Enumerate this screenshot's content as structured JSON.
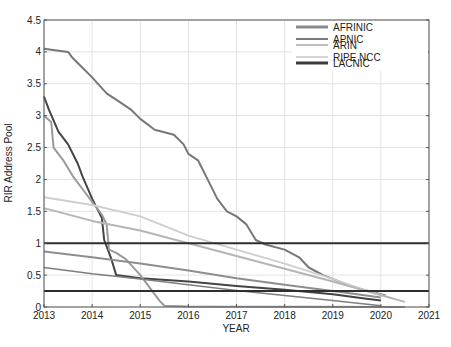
{
  "chart_data": {
    "type": "line",
    "title": "",
    "xlabel": "YEAR",
    "ylabel": "RIR Address Pool",
    "xlim": [
      2013,
      2021
    ],
    "ylim": [
      0,
      4.5
    ],
    "grid": true,
    "legend_position": "top-right",
    "xticks": [
      "2013",
      "2014",
      "2015",
      "2016",
      "2017",
      "2018",
      "2019",
      "2020",
      "2021"
    ],
    "yticks": [
      "0",
      "0.5",
      "1",
      "1.5",
      "2",
      "2.5",
      "3",
      "3.5",
      "4",
      "4.5"
    ],
    "legend": [
      {
        "name": "AFRINIC",
        "color": "#8a8a8a",
        "width": 3
      },
      {
        "name": "APNIC",
        "color": "#7a7a7a",
        "width": 2
      },
      {
        "name": "ARIN",
        "color": "#bdbdbd",
        "width": 2
      },
      {
        "name": "RIPE NCC",
        "color": "#d4d4d4",
        "width": 2
      },
      {
        "name": "LACNIC",
        "color": "#3c3c3c",
        "width": 3
      }
    ],
    "series": [
      {
        "name": "APNIC (upper stepped)",
        "color": "#777777",
        "width": 2,
        "points": [
          [
            2013.0,
            4.05
          ],
          [
            2013.5,
            4.0
          ],
          [
            2013.6,
            3.9
          ],
          [
            2013.8,
            3.75
          ],
          [
            2014.0,
            3.6
          ],
          [
            2014.3,
            3.35
          ],
          [
            2014.6,
            3.2
          ],
          [
            2014.8,
            3.1
          ],
          [
            2015.0,
            2.95
          ],
          [
            2015.3,
            2.78
          ],
          [
            2015.7,
            2.7
          ],
          [
            2015.9,
            2.55
          ],
          [
            2016.0,
            2.4
          ],
          [
            2016.2,
            2.3
          ],
          [
            2016.4,
            2.0
          ],
          [
            2016.6,
            1.7
          ],
          [
            2016.8,
            1.5
          ],
          [
            2017.0,
            1.42
          ],
          [
            2017.2,
            1.3
          ],
          [
            2017.4,
            1.05
          ],
          [
            2017.6,
            0.98
          ],
          [
            2018.0,
            0.9
          ],
          [
            2018.3,
            0.78
          ],
          [
            2018.5,
            0.62
          ],
          [
            2018.8,
            0.5
          ],
          [
            2019.0,
            0.44
          ],
          [
            2019.3,
            0.35
          ],
          [
            2019.6,
            0.28
          ],
          [
            2019.9,
            0.22
          ],
          [
            2020.1,
            0.18
          ]
        ]
      },
      {
        "name": "LACNIC (early steep)",
        "color": "#444444",
        "width": 2,
        "points": [
          [
            2013.0,
            3.3
          ],
          [
            2013.1,
            3.1
          ],
          [
            2013.3,
            2.75
          ],
          [
            2013.5,
            2.55
          ],
          [
            2013.7,
            2.25
          ],
          [
            2013.8,
            2.05
          ],
          [
            2014.0,
            1.7
          ],
          [
            2014.2,
            1.4
          ],
          [
            2014.25,
            1.05
          ],
          [
            2014.4,
            0.75
          ],
          [
            2014.5,
            0.5
          ],
          [
            2015.0,
            0.45
          ],
          [
            2016.0,
            0.4
          ],
          [
            2017.0,
            0.33
          ],
          [
            2018.0,
            0.27
          ],
          [
            2019.0,
            0.2
          ],
          [
            2019.7,
            0.13
          ],
          [
            2020.0,
            0.1
          ]
        ]
      },
      {
        "name": "ARIN (early drop)",
        "color": "#9a9a9a",
        "width": 2,
        "points": [
          [
            2013.0,
            3.0
          ],
          [
            2013.15,
            2.9
          ],
          [
            2013.2,
            2.5
          ],
          [
            2013.4,
            2.3
          ],
          [
            2013.6,
            2.05
          ],
          [
            2013.8,
            1.85
          ],
          [
            2014.0,
            1.65
          ],
          [
            2014.2,
            1.45
          ],
          [
            2014.3,
            1.3
          ],
          [
            2014.35,
            0.9
          ],
          [
            2014.5,
            0.85
          ],
          [
            2014.7,
            0.75
          ],
          [
            2015.0,
            0.5
          ],
          [
            2015.2,
            0.3
          ],
          [
            2015.4,
            0.1
          ],
          [
            2015.5,
            0.02
          ],
          [
            2016.0,
            0.01
          ],
          [
            2020.5,
            0.0
          ]
        ]
      },
      {
        "name": "RIPE NCC (linear light)",
        "color": "#cfcfcf",
        "width": 2,
        "points": [
          [
            2013.0,
            1.72
          ],
          [
            2014.0,
            1.6
          ],
          [
            2015.0,
            1.42
          ],
          [
            2016.0,
            1.12
          ],
          [
            2017.0,
            0.9
          ],
          [
            2018.0,
            0.68
          ],
          [
            2019.0,
            0.44
          ],
          [
            2019.6,
            0.28
          ],
          [
            2020.3,
            0.12
          ]
        ]
      },
      {
        "name": "ARIN (linear light)",
        "color": "#b5b5b5",
        "width": 2,
        "points": [
          [
            2013.0,
            1.55
          ],
          [
            2014.0,
            1.35
          ],
          [
            2015.0,
            1.2
          ],
          [
            2016.0,
            1.0
          ],
          [
            2017.0,
            0.8
          ],
          [
            2018.0,
            0.6
          ],
          [
            2019.0,
            0.4
          ],
          [
            2019.7,
            0.25
          ],
          [
            2020.5,
            0.08
          ]
        ]
      },
      {
        "name": "AFRINIC (linear mid)",
        "color": "#8e8e8e",
        "width": 2,
        "points": [
          [
            2013.0,
            0.87
          ],
          [
            2014.0,
            0.78
          ],
          [
            2015.0,
            0.68
          ],
          [
            2016.0,
            0.57
          ],
          [
            2017.0,
            0.45
          ],
          [
            2018.0,
            0.35
          ],
          [
            2019.0,
            0.25
          ],
          [
            2020.0,
            0.15
          ]
        ]
      },
      {
        "name": "LACNIC (linear low)",
        "color": "#7e7e7e",
        "width": 1.5,
        "points": [
          [
            2013.0,
            0.62
          ],
          [
            2014.0,
            0.52
          ],
          [
            2015.0,
            0.44
          ],
          [
            2016.0,
            0.35
          ],
          [
            2017.0,
            0.26
          ],
          [
            2018.0,
            0.18
          ],
          [
            2019.0,
            0.1
          ],
          [
            2020.0,
            0.02
          ]
        ]
      },
      {
        "name": "Threshold 1.0",
        "color": "#2e2e2e",
        "width": 2,
        "points": [
          [
            2013,
            1.0
          ],
          [
            2021,
            1.0
          ]
        ]
      },
      {
        "name": "Threshold 0.25",
        "color": "#2e2e2e",
        "width": 2,
        "points": [
          [
            2013,
            0.25
          ],
          [
            2021,
            0.25
          ]
        ]
      }
    ]
  }
}
